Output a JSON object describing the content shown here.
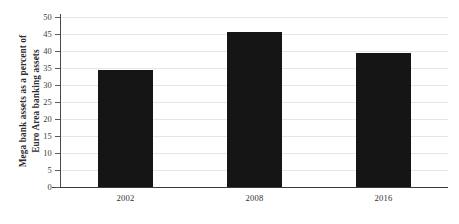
{
  "chart_data": {
    "type": "bar",
    "title": "",
    "xlabel": "",
    "ylabel": "Mega bank assets as a percent of Euro Area banking assets",
    "ylabel_lines": [
      "Mega bank assets as a percent of",
      "Euro Area banking assets"
    ],
    "categories": [
      "2002",
      "2008",
      "2016"
    ],
    "values": [
      34.5,
      45.5,
      39.5
    ],
    "ylim": [
      0,
      50
    ],
    "ytick_step": 5,
    "yticks": [
      "0",
      "5",
      "10",
      "15",
      "20",
      "25",
      "30",
      "35",
      "40",
      "45",
      "50"
    ],
    "grid": true,
    "legend": false,
    "bar_color": "#151515",
    "grid_color": "#e6e6e6",
    "axis_color": "#3a3a3a"
  }
}
